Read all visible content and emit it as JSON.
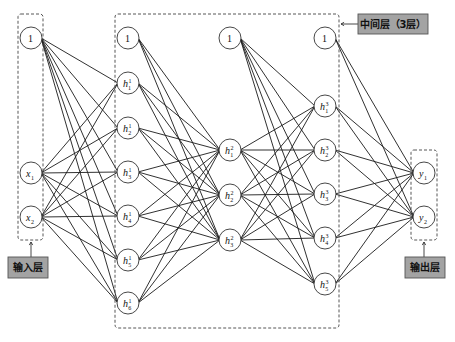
{
  "diagram": {
    "type": "neural-network",
    "node_radius": 11,
    "layers": [
      {
        "name": "input",
        "x": 31,
        "nodes": [
          {
            "id": "in-bias",
            "label": "1",
            "bias": true,
            "y": 38
          },
          {
            "id": "x1",
            "label": "x",
            "sub": "1",
            "y": 173
          },
          {
            "id": "x2",
            "label": "x",
            "sub": "2",
            "y": 217
          }
        ]
      },
      {
        "name": "hidden1",
        "x": 128,
        "nodes": [
          {
            "id": "h1-bias",
            "label": "1",
            "bias": true,
            "y": 38
          },
          {
            "id": "h1_1",
            "label": "h",
            "sup": "1",
            "sub": "1",
            "y": 83
          },
          {
            "id": "h1_2",
            "label": "h",
            "sup": "1",
            "sub": "2",
            "y": 128
          },
          {
            "id": "h1_3",
            "label": "h",
            "sup": "1",
            "sub": "3",
            "y": 172
          },
          {
            "id": "h1_4",
            "label": "h",
            "sup": "1",
            "sub": "4",
            "y": 216
          },
          {
            "id": "h1_5",
            "label": "h",
            "sup": "1",
            "sub": "5",
            "y": 260
          },
          {
            "id": "h1_6",
            "label": "h",
            "sup": "1",
            "sub": "6",
            "y": 303
          }
        ]
      },
      {
        "name": "hidden2",
        "x": 230,
        "nodes": [
          {
            "id": "h2-bias",
            "label": "1",
            "bias": true,
            "y": 38
          },
          {
            "id": "h2_1",
            "label": "h",
            "sup": "2",
            "sub": "1",
            "y": 150
          },
          {
            "id": "h2_2",
            "label": "h",
            "sup": "2",
            "sub": "2",
            "y": 195
          },
          {
            "id": "h2_3",
            "label": "h",
            "sup": "2",
            "sub": "3",
            "y": 240
          }
        ]
      },
      {
        "name": "hidden3",
        "x": 325,
        "nodes": [
          {
            "id": "h3-bias",
            "label": "1",
            "bias": true,
            "y": 38
          },
          {
            "id": "h3_1",
            "label": "h",
            "sup": "3",
            "sub": "1",
            "y": 106
          },
          {
            "id": "h3_2",
            "label": "h",
            "sup": "3",
            "sub": "2",
            "y": 150
          },
          {
            "id": "h3_3",
            "label": "h",
            "sup": "3",
            "sub": "3",
            "y": 194
          },
          {
            "id": "h3_4",
            "label": "h",
            "sup": "3",
            "sub": "4",
            "y": 238
          },
          {
            "id": "h3_5",
            "label": "h",
            "sup": "3",
            "sub": "5",
            "y": 284
          }
        ]
      },
      {
        "name": "output",
        "x": 424,
        "nodes": [
          {
            "id": "y1",
            "label": "y",
            "sub": "1",
            "y": 173
          },
          {
            "id": "y2",
            "label": "y",
            "sub": "2",
            "y": 217
          }
        ]
      }
    ],
    "groups": [
      {
        "id": "input-group",
        "x": 18,
        "y": 14,
        "w": 25,
        "h": 226
      },
      {
        "id": "hidden-group",
        "x": 115,
        "y": 14,
        "w": 224,
        "h": 314
      },
      {
        "id": "output-group",
        "x": 411,
        "y": 150,
        "w": 26,
        "h": 90
      }
    ],
    "labels": {
      "input": {
        "text": "输入层",
        "x": 8,
        "y": 257,
        "w": 40,
        "h": 21,
        "arrow_from": [
          31,
          257
        ],
        "arrow_to": [
          31,
          242
        ]
      },
      "hidden": {
        "text": "中间层（3层）",
        "x": 358,
        "y": 14,
        "w": 70,
        "h": 20,
        "arrow_from": [
          358,
          24
        ],
        "arrow_to": [
          341,
          24
        ]
      },
      "output": {
        "text": "输出层",
        "x": 405,
        "y": 257,
        "w": 40,
        "h": 21,
        "arrow_from": [
          424,
          257
        ],
        "arrow_to": [
          424,
          242
        ]
      }
    }
  }
}
